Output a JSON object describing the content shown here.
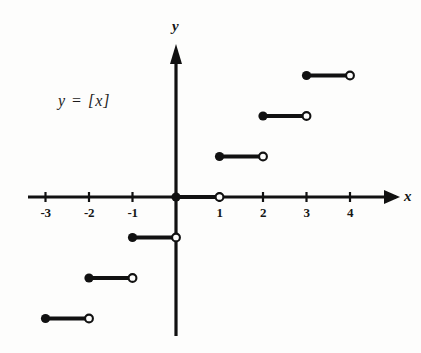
{
  "figure": {
    "equation_label": "y = [x]",
    "background_color": "#fdfdfc",
    "ink_color": "#111111"
  },
  "axes": {
    "x_axis_label": "x",
    "y_axis_label": "y",
    "x_tick_labels": [
      "-3",
      "-2",
      "-1",
      "1",
      "2",
      "3",
      "4"
    ],
    "y_tick_labels": []
  },
  "chart_data": {
    "type": "line",
    "title": "y = [x]",
    "subtitle": "",
    "xlabel": "x",
    "ylabel": "y",
    "xlim": [
      -3.6,
      4.6
    ],
    "ylim": [
      -3.7,
      3.8
    ],
    "grid": false,
    "legend": "none",
    "function": "greatest integer (floor) step function",
    "x_ticks": [
      -3,
      -2,
      -1,
      1,
      2,
      3,
      4
    ],
    "y_ticks": [],
    "annotations": [
      {
        "text": "y = [x]",
        "x": -1.75,
        "y": 2.3
      }
    ],
    "segments": [
      {
        "y": -3,
        "x_start": -3,
        "x_end": -2,
        "start_point": "closed",
        "end_point": "open"
      },
      {
        "y": -2,
        "x_start": -2,
        "x_end": -1,
        "start_point": "closed",
        "end_point": "open"
      },
      {
        "y": -1,
        "x_start": -1,
        "x_end": 0,
        "start_point": "closed",
        "end_point": "open"
      },
      {
        "y": 0,
        "x_start": 0,
        "x_end": 1,
        "start_point": "closed",
        "end_point": "open"
      },
      {
        "y": 1,
        "x_start": 1,
        "x_end": 2,
        "start_point": "closed",
        "end_point": "open"
      },
      {
        "y": 2,
        "x_start": 2,
        "x_end": 3,
        "start_point": "closed",
        "end_point": "open"
      },
      {
        "y": 3,
        "x_start": 3,
        "x_end": 4,
        "start_point": "closed",
        "end_point": "open"
      }
    ]
  },
  "geometry": {
    "origin_x": 176,
    "origin_y": 197,
    "unit_x": 43.5,
    "unit_y": 40.5
  }
}
